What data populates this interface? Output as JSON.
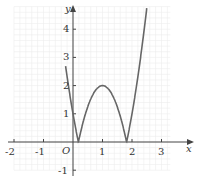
{
  "chart_data": {
    "type": "line",
    "title": "",
    "function": "y = |2 - 3(x - 1)^2|",
    "xlabel": "x",
    "ylabel": "y",
    "origin_label": "O",
    "xlim": [
      -2,
      3.3
    ],
    "ylim": [
      -1,
      4.8
    ],
    "x_ticks": [
      "-2",
      "-1",
      "1",
      "2",
      "3"
    ],
    "y_ticks": [
      "4",
      "3",
      "2",
      "1",
      "-1"
    ],
    "grid": true,
    "series": [
      {
        "name": "curve",
        "x": [
          -0.2,
          0,
          0.18,
          0.5,
          1,
          1.5,
          1.82,
          2,
          2.5
        ],
        "y": [
          2.32,
          1,
          0,
          1.25,
          2,
          1.25,
          0,
          1,
          4.75
        ]
      }
    ],
    "key_points": {
      "peak": [
        1,
        2
      ],
      "zeros": [
        0.18,
        1.82
      ]
    }
  },
  "labels": {
    "x_axis": "x",
    "y_axis": "y",
    "origin": "O",
    "xt": [
      "-2",
      "-1",
      "1",
      "2",
      "3"
    ],
    "yt": [
      "4",
      "3",
      "2",
      "1",
      "-1"
    ]
  }
}
